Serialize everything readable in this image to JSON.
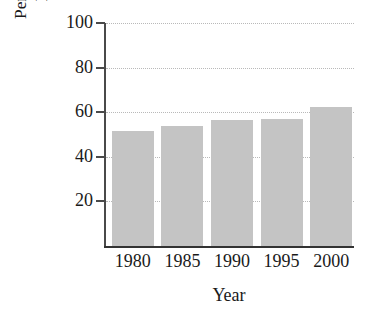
{
  "chart_data": {
    "type": "bar",
    "title": "",
    "xlabel": "Year",
    "ylabel_line1": "Percentage in the",
    "ylabel_line2": "Labor Force",
    "categories": [
      "1980",
      "1985",
      "1990",
      "1995",
      "2000"
    ],
    "values": [
      51.5,
      54.0,
      56.5,
      57.0,
      62.5
    ],
    "ylim": [
      0,
      100
    ],
    "yticks": [
      20,
      40,
      60,
      80,
      100
    ],
    "ytick_labels": [
      "20",
      "40",
      "60",
      "80",
      "100"
    ],
    "grid": "horizontal-dotted",
    "legend": "none",
    "bar_color": "#c4c4c4",
    "axis_color": "#4a4a4a",
    "gridline_color": "#b9b9b9"
  }
}
